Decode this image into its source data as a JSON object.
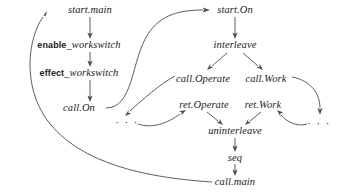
{
  "diagram": {
    "stroke_color": "#4d4d4d",
    "text_color": "#1a1a1a",
    "background": "#ffffff",
    "nodes": [
      {
        "id": "start_main",
        "label": "start.main",
        "x": 90,
        "y": 10,
        "style": "italic"
      },
      {
        "id": "enable_worksw",
        "label": "enable_workswitch",
        "x": 79,
        "y": 45,
        "style": "keyword-italic",
        "keyword": "enable",
        "rest": "_workswitch"
      },
      {
        "id": "effect_worksw",
        "label": "effect_workswitch",
        "x": 79,
        "y": 73,
        "style": "keyword-italic",
        "keyword": "effect",
        "rest": "_workswitch"
      },
      {
        "id": "call_on",
        "label": "call.On",
        "x": 79,
        "y": 108,
        "style": "italic"
      },
      {
        "id": "start_on",
        "label": "start.On",
        "x": 235,
        "y": 10,
        "style": "italic"
      },
      {
        "id": "interleave",
        "label": "interleave",
        "x": 235,
        "y": 45,
        "style": "italic"
      },
      {
        "id": "call_operate",
        "label": "call.Operate",
        "x": 203,
        "y": 79,
        "style": "italic"
      },
      {
        "id": "call_work",
        "label": "call.Work",
        "x": 266,
        "y": 79,
        "style": "italic"
      },
      {
        "id": "ret_operate",
        "label": "ret.Operate",
        "x": 204,
        "y": 105,
        "style": "italic"
      },
      {
        "id": "ret_work",
        "label": "ret.Work",
        "x": 263,
        "y": 105,
        "style": "italic"
      },
      {
        "id": "uninterleave",
        "label": "uninterleave",
        "x": 235,
        "y": 131,
        "style": "italic"
      },
      {
        "id": "seq",
        "label": "seq",
        "x": 235,
        "y": 158,
        "style": "italic"
      },
      {
        "id": "call_main",
        "label": "call.main",
        "x": 235,
        "y": 182,
        "style": "italic"
      },
      {
        "id": "ellipsis_left",
        "label": "· · ·",
        "x": 127,
        "y": 122,
        "style": "ellipsis"
      },
      {
        "id": "ellipsis_right",
        "label": "· · ·",
        "x": 319,
        "y": 123,
        "style": "ellipsis"
      }
    ],
    "edges": [
      {
        "id": "e-start_main-enable",
        "from": "start_main",
        "to": "enable_worksw",
        "kind": "straight-down"
      },
      {
        "id": "e-enable-effect",
        "from": "enable_worksw",
        "to": "effect_worksw",
        "kind": "straight-down"
      },
      {
        "id": "e-effect-call_on",
        "from": "effect_worksw",
        "to": "call_on",
        "kind": "straight-down"
      },
      {
        "id": "e-call_on-start_on",
        "from": "call_on",
        "to": "start_on",
        "kind": "curve-up-right"
      },
      {
        "id": "e-call_on-ellipsis_left",
        "from": "call_on",
        "to": "ellipsis_left",
        "kind": "curve-down"
      },
      {
        "id": "e-start_on-interleave",
        "from": "start_on",
        "to": "interleave",
        "kind": "straight-down"
      },
      {
        "id": "e-interleave-call_op",
        "from": "interleave",
        "to": "call_operate",
        "kind": "diagonal-left"
      },
      {
        "id": "e-interleave-call_work",
        "from": "interleave",
        "to": "call_work",
        "kind": "diagonal-right"
      },
      {
        "id": "e-call_op-ellipsis_left",
        "from": "call_operate",
        "to": "ellipsis_left",
        "kind": "curve-down-left"
      },
      {
        "id": "e-call_work-ellipsis_rt",
        "from": "call_work",
        "to": "ellipsis_right",
        "kind": "curve-down-right"
      },
      {
        "id": "e-ellipsis_left-ret_op",
        "from": "ellipsis_left",
        "to": "ret_operate",
        "kind": "curve-up-right"
      },
      {
        "id": "e-ellipsis_rt-ret_work",
        "from": "ellipsis_right",
        "to": "ret_work",
        "kind": "curve-up-left"
      },
      {
        "id": "e-ret_op-uninterleave",
        "from": "ret_operate",
        "to": "uninterleave",
        "kind": "diagonal-right"
      },
      {
        "id": "e-ret_work-uninterleave",
        "from": "ret_work",
        "to": "uninterleave",
        "kind": "diagonal-left"
      },
      {
        "id": "e-uninterleave-seq",
        "from": "uninterleave",
        "to": "seq",
        "kind": "straight-down"
      },
      {
        "id": "e-seq-call_main",
        "from": "seq",
        "to": "call_main",
        "kind": "straight-down"
      },
      {
        "id": "e-call_main-start_main",
        "from": "call_main",
        "to": "start_main",
        "kind": "long-loop-left"
      }
    ]
  }
}
